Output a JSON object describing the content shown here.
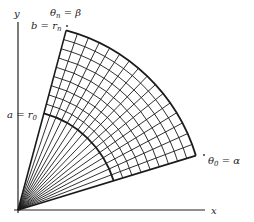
{
  "diagram": {
    "axes": {
      "x_label": "x",
      "y_label": "y"
    },
    "labels": {
      "theta_n": "θ",
      "theta_n_sub": "n",
      "theta_n_rhs": " = β",
      "b_lhs": "b = r",
      "b_sub": "n",
      "a_lhs": "a = r",
      "a_sub": "0",
      "theta_0": "θ",
      "theta_0_sub": "0",
      "theta_0_rhs": " = α"
    },
    "geometry": {
      "origin": [
        18,
        210
      ],
      "inner_radius": 100,
      "outer_radius": 186,
      "alpha_deg": 17,
      "beta_deg": 75,
      "radial_divisions": 9,
      "angular_divisions": 16,
      "line_color": "#1a1a1a"
    }
  }
}
